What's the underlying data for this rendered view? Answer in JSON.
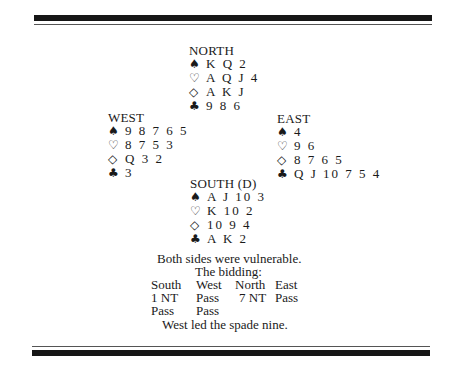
{
  "hands": {
    "north": {
      "title": "NORTH",
      "spades": "K Q 2",
      "hearts": "A Q J 4",
      "diamonds": "A K J",
      "clubs": "9 8 6"
    },
    "west": {
      "title": "WEST",
      "spades": "9 8 7 6 5",
      "hearts": "8 7 5 3",
      "diamonds": "Q 3 2",
      "clubs": "3"
    },
    "east": {
      "title": "EAST",
      "spades": "4",
      "hearts": "9 6",
      "diamonds": "8 7 6 5",
      "clubs": "Q J 10 7 5 4"
    },
    "south": {
      "title": "SOUTH (D)",
      "spades": "A J 10 3",
      "hearts": "K 10 2",
      "diamonds": "10 9 4",
      "clubs": "A K 2"
    }
  },
  "suit_symbols": {
    "spades": "♠",
    "hearts": "♡",
    "diamonds": "◇",
    "clubs": "♣"
  },
  "vulnerability": "Both sides were vulnerable.",
  "bidding": {
    "heading": "The bidding:",
    "columns": [
      "South",
      "West",
      "North",
      "East"
    ],
    "rows": [
      [
        "1 NT",
        "Pass",
        "7 NT",
        "Pass"
      ],
      [
        "Pass",
        "Pass",
        "",
        ""
      ]
    ]
  },
  "opening_lead": "West led the spade nine."
}
